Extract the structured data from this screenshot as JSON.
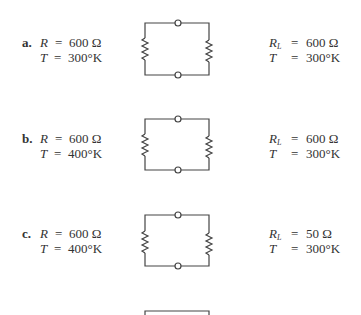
{
  "rows": [
    {
      "label": "a.",
      "source": {
        "r_var": "R",
        "r_eq": "=",
        "r_val": "600 Ω",
        "t_var": "T",
        "t_eq": "=",
        "t_val": "300°K"
      },
      "load": {
        "r_var": "R",
        "r_sub": "L",
        "r_eq": "=",
        "r_val": "600 Ω",
        "t_var": "T",
        "t_eq": "=",
        "t_val": "300°K"
      }
    },
    {
      "label": "b.",
      "source": {
        "r_var": "R",
        "r_eq": "=",
        "r_val": "600 Ω",
        "t_var": "T",
        "t_eq": "=",
        "t_val": "400°K"
      },
      "load": {
        "r_var": "R",
        "r_sub": "L",
        "r_eq": "=",
        "r_val": "600 Ω",
        "t_var": "T",
        "t_eq": "=",
        "t_val": "300°K"
      }
    },
    {
      "label": "c.",
      "source": {
        "r_var": "R",
        "r_eq": "=",
        "r_val": "600 Ω",
        "t_var": "T",
        "t_eq": "=",
        "t_val": "400°K"
      },
      "load": {
        "r_var": "R",
        "r_sub": "L",
        "r_eq": "=",
        "r_val": "50 Ω",
        "t_var": "T",
        "t_eq": "=",
        "t_val": "300°K"
      }
    }
  ],
  "colors": {
    "line": "#444444",
    "text": "#333333"
  }
}
